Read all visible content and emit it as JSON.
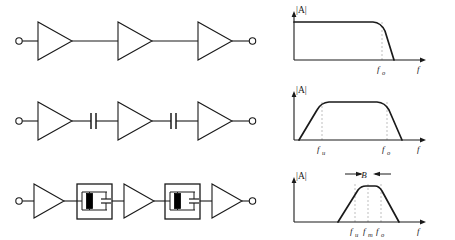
{
  "figure": {
    "background_color": "#ffffff",
    "line_color": "#1a1a1a",
    "dash_color": "#b0b0b0",
    "crystal_fill": "#000000",
    "rows": [
      {
        "id": "wideband",
        "circuit": {
          "type": "amplifier-chain",
          "stages": 3,
          "coupling": "direct",
          "coupling_symbol": "wire",
          "input_terminal": "open-circle",
          "output_terminal": "open-circle"
        },
        "chart": {
          "type": "line",
          "title": "",
          "ylabel": "|A|",
          "xlabel": "f",
          "response": "low-pass",
          "markers": [
            {
              "name": "f_o",
              "base": "f",
              "sub": "o",
              "x": 0.74
            }
          ],
          "x": [
            0.0,
            0.02,
            0.06,
            0.7,
            0.74,
            0.8,
            0.86
          ],
          "y": [
            0.0,
            0.78,
            0.86,
            0.86,
            0.8,
            0.4,
            0.0
          ],
          "ylim": [
            0,
            1
          ],
          "xlim": [
            0,
            1
          ],
          "grid": false,
          "legend": false
        }
      },
      {
        "id": "bandpass",
        "circuit": {
          "type": "amplifier-chain",
          "stages": 3,
          "coupling": "capacitive",
          "coupling_symbol": "capacitor",
          "input_terminal": "open-circle",
          "output_terminal": "open-circle"
        },
        "chart": {
          "type": "line",
          "title": "",
          "ylabel": "|A|",
          "xlabel": "f",
          "response": "band-pass",
          "markers": [
            {
              "name": "f_u",
              "base": "f",
              "sub": "u",
              "x": 0.22
            },
            {
              "name": "f_o",
              "base": "f",
              "sub": "o",
              "x": 0.74
            }
          ],
          "x": [
            0.04,
            0.1,
            0.22,
            0.3,
            0.66,
            0.74,
            0.84
          ],
          "y": [
            0.0,
            0.22,
            0.72,
            0.86,
            0.86,
            0.7,
            0.0
          ],
          "ylim": [
            0,
            1
          ],
          "xlim": [
            0,
            1
          ],
          "grid": false,
          "legend": false
        }
      },
      {
        "id": "narrowband",
        "circuit": {
          "type": "amplifier-chain",
          "stages": 3,
          "coupling": "crystal-filter",
          "coupling_symbol": "shielded-crystal",
          "filter_contents": [
            "crystal",
            "capacitor"
          ],
          "input_terminal": "open-circle",
          "output_terminal": "open-circle"
        },
        "chart": {
          "type": "line",
          "title": "",
          "ylabel": "|A|",
          "xlabel": "f",
          "response": "narrow-band-pass",
          "bandwidth_label": "B",
          "markers": [
            {
              "name": "f_u",
              "base": "f",
              "sub": "u",
              "x": 0.47
            },
            {
              "name": "f_m",
              "base": "f",
              "sub": "m",
              "x": 0.57
            },
            {
              "name": "f_o",
              "base": "f",
              "sub": "o",
              "x": 0.67
            }
          ],
          "x": [
            0.34,
            0.4,
            0.47,
            0.52,
            0.62,
            0.67,
            0.74,
            0.8
          ],
          "y": [
            0.0,
            0.24,
            0.6,
            0.8,
            0.8,
            0.6,
            0.22,
            0.0
          ],
          "ylim": [
            0,
            1
          ],
          "xlim": [
            0,
            1
          ],
          "grid": false,
          "legend": false
        }
      }
    ]
  }
}
